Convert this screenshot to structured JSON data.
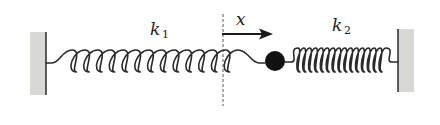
{
  "diagram": {
    "labels": {
      "spring_left": {
        "symbol": "k",
        "subscript": "1"
      },
      "spring_right": {
        "symbol": "k",
        "subscript": "2"
      },
      "displacement": "x"
    },
    "elements": {
      "left_wall": {
        "x": 30,
        "y": 32,
        "width": 16,
        "height": 63
      },
      "right_wall": {
        "x": 398,
        "y": 29,
        "width": 16,
        "height": 63
      },
      "spring_left": {
        "x_start": 46,
        "x_end": 265,
        "coils": 13,
        "y": 61
      },
      "spring_right": {
        "x_start": 285,
        "x_end": 398,
        "coils": 15,
        "y": 60
      },
      "mass": {
        "cx": 275,
        "cy": 61,
        "r": 10
      },
      "equilibrium_line": {
        "x": 223,
        "y_top": 14,
        "y_bottom": 106
      },
      "arrow": {
        "x_start": 222,
        "x_end": 273,
        "y": 34
      }
    },
    "colors": {
      "line": "#2a2a2a",
      "wall_fill": "#d8d8d4",
      "mass": "#111111",
      "background": "#ffffff"
    }
  }
}
